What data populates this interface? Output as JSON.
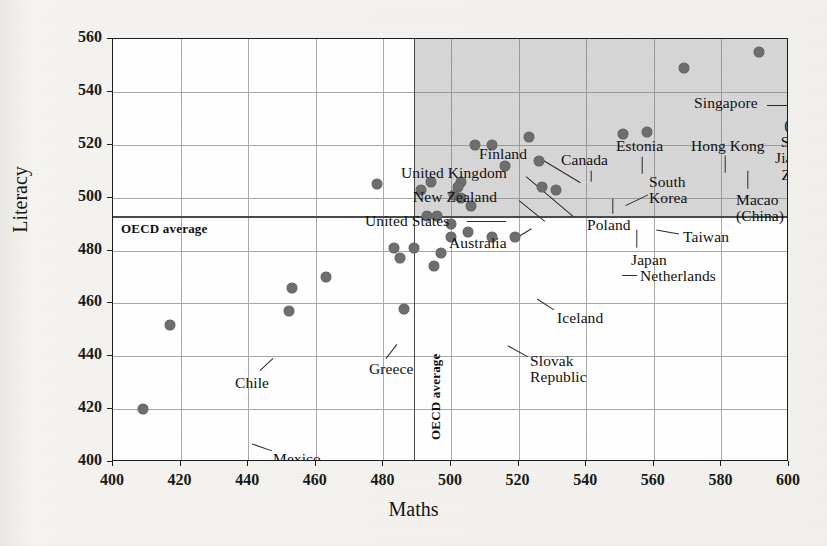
{
  "chart_data": {
    "type": "scatter",
    "title": "",
    "xlabel": "Maths",
    "ylabel": "Literacy",
    "xlim": [
      400,
      600
    ],
    "ylim": [
      400,
      560
    ],
    "xticks": [
      400,
      420,
      440,
      460,
      480,
      500,
      520,
      540,
      560,
      580,
      600
    ],
    "yticks": [
      400,
      420,
      440,
      460,
      480,
      500,
      520,
      540,
      560
    ],
    "grid": true,
    "legend": null,
    "reference_lines": [
      {
        "name": "oecd-average-maths",
        "axis": "x",
        "value": 489,
        "label": "OECD average"
      },
      {
        "name": "oecd-average-literacy",
        "axis": "y",
        "value": 493,
        "label": "OECD average"
      }
    ],
    "shaded_region": {
      "name": "above-average-quadrant",
      "x_from": 489,
      "x_to": 600,
      "y_from": 493,
      "y_to": 560,
      "color": "#787878",
      "opacity": 0.3
    },
    "points": [
      {
        "label": "China (Beijing, Shanghai, Jiangsu and Zhejiang)",
        "x": 591,
        "y": 555
      },
      {
        "label": "Singapore",
        "x": 569,
        "y": 549
      },
      {
        "label": "Macao (China)",
        "x": 558,
        "y": 525
      },
      {
        "label": "Hong Kong",
        "x": 551,
        "y": 524
      },
      {
        "label": "Estonia",
        "x": 523,
        "y": 523
      },
      {
        "label": "Canada",
        "x": 512,
        "y": 520
      },
      {
        "label": "Finland",
        "x": 507,
        "y": 520
      },
      {
        "label": "South Korea",
        "x": 526,
        "y": 514
      },
      {
        "label": "Poland",
        "x": 516,
        "y": 512
      },
      {
        "label": "",
        "x": 503,
        "y": 506
      },
      {
        "label": "New Zealand",
        "x": 494,
        "y": 506
      },
      {
        "label": "United Kingdom",
        "x": 502,
        "y": 504
      },
      {
        "label": "Taiwan",
        "x": 531,
        "y": 503
      },
      {
        "label": "Japan",
        "x": 527,
        "y": 504
      },
      {
        "label": "Australia",
        "x": 491,
        "y": 503
      },
      {
        "label": "",
        "x": 501,
        "y": 501
      },
      {
        "label": "",
        "x": 503,
        "y": 500
      },
      {
        "label": "United States",
        "x": 478,
        "y": 505
      },
      {
        "label": "",
        "x": 506,
        "y": 497
      },
      {
        "label": "",
        "x": 493,
        "y": 493
      },
      {
        "label": "",
        "x": 496,
        "y": 493
      },
      {
        "label": "",
        "x": 500,
        "y": 490
      },
      {
        "label": "",
        "x": 505,
        "y": 487
      },
      {
        "label": "Netherlands",
        "x": 519,
        "y": 485
      },
      {
        "label": "",
        "x": 512,
        "y": 485
      },
      {
        "label": "",
        "x": 500,
        "y": 485
      },
      {
        "label": "",
        "x": 489,
        "y": 481
      },
      {
        "label": "",
        "x": 483,
        "y": 481
      },
      {
        "label": "Iceland",
        "x": 495,
        "y": 474
      },
      {
        "label": "",
        "x": 485,
        "y": 477
      },
      {
        "label": "",
        "x": 497,
        "y": 479
      },
      {
        "label": "",
        "x": 463,
        "y": 470
      },
      {
        "label": "",
        "x": 453,
        "y": 466
      },
      {
        "label": "Greece",
        "x": 452,
        "y": 457
      },
      {
        "label": "Slovak Republic",
        "x": 486,
        "y": 458
      },
      {
        "label": "Chile",
        "x": 417,
        "y": 452
      },
      {
        "label": "Mexico",
        "x": 409,
        "y": 420
      }
    ],
    "annotations": [
      {
        "name": "label-china",
        "text": "China\n(Beijing,\nShanghai,\nJiangsu and\nZhejiang)",
        "x": 699,
        "y": 62,
        "align": "center",
        "leader": {
          "x1": 741,
          "y1": 82,
          "x2": 757,
          "y2": 53
        }
      },
      {
        "name": "label-singapore",
        "text": "Singapore",
        "x": 581,
        "y": 56,
        "align": "left",
        "leader": {
          "x1": 654,
          "y1": 66,
          "x2": 689,
          "y2": 66
        }
      },
      {
        "name": "label-hong-kong",
        "text": "Hong Kong",
        "x": 578,
        "y": 99,
        "align": "left",
        "leader": {
          "x1": 612,
          "y1": 116,
          "x2": 612,
          "y2": 133
        }
      },
      {
        "name": "label-macao",
        "text": "Macao\n(China)",
        "x": 623,
        "y": 153,
        "align": "left",
        "leader": {
          "x1": 635,
          "y1": 149,
          "x2": 635,
          "y2": 131
        }
      },
      {
        "name": "label-estonia",
        "text": "Estonia",
        "x": 503,
        "y": 99,
        "align": "left",
        "leader": {
          "x1": 529,
          "y1": 117,
          "x2": 529,
          "y2": 134
        }
      },
      {
        "name": "label-canada",
        "text": "Canada",
        "x": 448,
        "y": 113,
        "align": "left",
        "leader": {
          "x1": 478,
          "y1": 131,
          "x2": 478,
          "y2": 142
        }
      },
      {
        "name": "label-finland",
        "text": "Finland",
        "x": 366,
        "y": 107,
        "align": "left",
        "leader": {
          "x1": 427,
          "y1": 119,
          "x2": 467,
          "y2": 143
        }
      },
      {
        "name": "label-south-korea",
        "text": "South\nKorea",
        "x": 536,
        "y": 135,
        "align": "left",
        "leader": {
          "x1": 535,
          "y1": 155,
          "x2": 512,
          "y2": 166
        }
      },
      {
        "name": "label-poland",
        "text": "Poland",
        "x": 474,
        "y": 178,
        "align": "left",
        "leader": {
          "x1": 500,
          "y1": 174,
          "x2": 500,
          "y2": 159
        }
      },
      {
        "name": "label-taiwan",
        "text": "Taiwan",
        "x": 570,
        "y": 190,
        "align": "left",
        "leader": {
          "x1": 566,
          "y1": 194,
          "x2": 543,
          "y2": 190
        }
      },
      {
        "name": "label-japan",
        "text": "Japan",
        "x": 518,
        "y": 213,
        "align": "left",
        "leader": {
          "x1": 524,
          "y1": 208,
          "x2": 524,
          "y2": 190
        }
      },
      {
        "name": "label-united-kingdom",
        "text": "United Kingdom",
        "x": 288,
        "y": 126,
        "align": "left",
        "leader": {
          "x1": 413,
          "y1": 137,
          "x2": 460,
          "y2": 177
        }
      },
      {
        "name": "label-new-zealand",
        "text": "New Zealand",
        "x": 300,
        "y": 150,
        "align": "left",
        "leader": {
          "x1": 406,
          "y1": 161,
          "x2": 432,
          "y2": 182
        }
      },
      {
        "name": "label-united-states",
        "text": "United States",
        "x": 252,
        "y": 174,
        "align": "left",
        "leader": {
          "x1": 354,
          "y1": 182,
          "x2": 393,
          "y2": 182
        }
      },
      {
        "name": "label-australia",
        "text": "Australia",
        "x": 336,
        "y": 196,
        "align": "left",
        "leader": {
          "x1": 404,
          "y1": 198,
          "x2": 419,
          "y2": 189
        }
      },
      {
        "name": "label-netherlands",
        "text": "Netherlands",
        "x": 527,
        "y": 229,
        "align": "left",
        "leader": {
          "x1": 509,
          "y1": 236,
          "x2": 524,
          "y2": 236
        }
      },
      {
        "name": "label-iceland",
        "text": "Iceland",
        "x": 444,
        "y": 271,
        "align": "left",
        "leader": {
          "x1": 441,
          "y1": 270,
          "x2": 424,
          "y2": 259
        }
      },
      {
        "name": "label-slovak-republic",
        "text": "Slovak\nRepublic",
        "x": 417,
        "y": 314,
        "align": "left",
        "leader": {
          "x1": 415,
          "y1": 317,
          "x2": 395,
          "y2": 306
        }
      },
      {
        "name": "label-greece",
        "text": "Greece",
        "x": 256,
        "y": 322,
        "align": "left",
        "leader": {
          "x1": 273,
          "y1": 319,
          "x2": 284,
          "y2": 305
        }
      },
      {
        "name": "label-chile",
        "text": "Chile",
        "x": 122,
        "y": 336,
        "align": "left",
        "leader": {
          "x1": 147,
          "y1": 331,
          "x2": 160,
          "y2": 319
        }
      },
      {
        "name": "label-mexico",
        "text": "Mexico",
        "x": 160,
        "y": 412,
        "align": "left",
        "leader": {
          "x1": 159,
          "y1": 411,
          "x2": 139,
          "y2": 404
        }
      }
    ]
  },
  "axes": {
    "x_tick_labels": [
      "400",
      "420",
      "440",
      "460",
      "480",
      "500",
      "520",
      "540",
      "560",
      "580",
      "600"
    ],
    "y_tick_labels": [
      "400",
      "420",
      "440",
      "460",
      "480",
      "500",
      "520",
      "540",
      "560"
    ],
    "x_title": "Maths",
    "y_title": "Literacy"
  },
  "reference_labels": {
    "horizontal": "OECD average",
    "vertical": "OECD average"
  },
  "colors": {
    "dot": "#6e6e6e",
    "axis": "#1d1d1d",
    "grid": "#a9a9a9",
    "shade": "#787878",
    "page_bg": "#f2f1ee",
    "plot_bg": "#ffffff"
  }
}
